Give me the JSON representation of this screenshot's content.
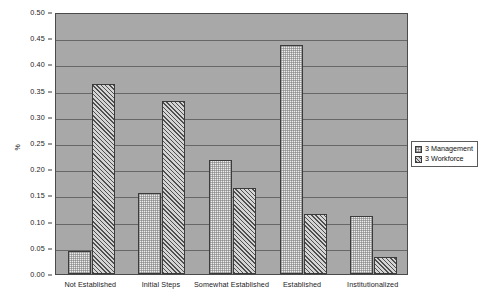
{
  "chart_data": {
    "type": "bar",
    "title": "",
    "subtitle": "",
    "xlabel": "",
    "ylabel": "%",
    "ylim": [
      0.0,
      0.5
    ],
    "ytick_labels": [
      "0.50",
      "0.45",
      "0.40",
      "0.35",
      "0.30",
      "0.25",
      "0.20",
      "0.15",
      "0.10",
      "0.05",
      "0.00"
    ],
    "ytick_values": [
      0.5,
      0.45,
      0.4,
      0.35,
      0.3,
      0.25,
      0.2,
      0.15,
      0.1,
      0.05,
      0.0
    ],
    "grid": true,
    "legend_position": "right",
    "categories": [
      "Not Established",
      "Initial Steps",
      "Somewhat Established",
      "Established",
      "Institutionalized"
    ],
    "series": [
      {
        "name": "3 Management",
        "pattern": "dotted-stipple",
        "values": [
          0.043,
          0.155,
          0.218,
          0.437,
          0.11
        ]
      },
      {
        "name": "3 Workforce",
        "pattern": "diagonal-hatch",
        "values": [
          0.362,
          0.33,
          0.165,
          0.115,
          0.033
        ]
      }
    ],
    "annotations": []
  },
  "colors": {
    "plot_background": "#a8a8a8",
    "gridline": "#676767",
    "axis": "#4a4a4a",
    "page_background": "#ffffff",
    "text": "#1a1a1a"
  }
}
